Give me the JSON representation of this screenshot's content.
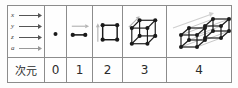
{
  "diagram": {
    "title_row_label": "次元",
    "axes_cell": {
      "name": "axis-legend",
      "axes": [
        {
          "label": "x",
          "icon": "right-arrow-icon"
        },
        {
          "label": "y",
          "icon": "right-arrow-icon"
        },
        {
          "label": "z",
          "icon": "right-arrow-icon"
        },
        {
          "label": "a",
          "icon": "right-arrow-icon"
        }
      ]
    },
    "columns": [
      {
        "dimension": "0",
        "figure_name": "point-figure",
        "figure_description": "single point",
        "vertices": 1,
        "extrusion_arrow": false
      },
      {
        "dimension": "1",
        "figure_name": "line-segment-figure",
        "figure_description": "line segment with two endpoints",
        "vertices": 2,
        "extrusion_arrow": true,
        "arrow_direction": "right"
      },
      {
        "dimension": "2",
        "figure_name": "square-figure",
        "figure_description": "square with four vertices",
        "vertices": 4,
        "extrusion_arrow": true,
        "arrow_direction": "up"
      },
      {
        "dimension": "3",
        "figure_name": "cube-figure",
        "figure_description": "cube with eight vertices",
        "vertices": 8,
        "extrusion_arrow": true,
        "arrow_direction": "up-right-diagonal"
      },
      {
        "dimension": "4",
        "figure_name": "tesseract-figure",
        "figure_description": "tesseract: two cubes joined by diagonal edges",
        "vertices": 16,
        "extrusion_arrow": true,
        "arrow_direction": "up-right-long-diagonal"
      }
    ],
    "colors": {
      "border": "#8c8c8c",
      "ink": "#1a1a1a",
      "faint_edge": "#bcbcbc",
      "background": "#fdfdfd",
      "text": "#2b2b2b"
    }
  }
}
